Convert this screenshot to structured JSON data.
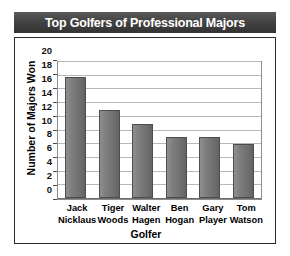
{
  "chart_data": {
    "type": "bar",
    "title": "Top Golfers of Professional Majors",
    "xlabel": "Golfer",
    "ylabel": "Number of Majors Won",
    "categories": [
      "Jack Nicklaus",
      "Tiger Woods",
      "Walter Hagen",
      "Ben Hogan",
      "Gary Player",
      "Tom Watson"
    ],
    "category_lines": [
      [
        "Jack",
        "Nicklaus"
      ],
      [
        "Tiger",
        "Woods"
      ],
      [
        "Walter",
        "Hagen"
      ],
      [
        "Ben",
        "Hogan"
      ],
      [
        "Gary",
        "Player"
      ],
      [
        "Tom",
        "Watson"
      ]
    ],
    "values": [
      18,
      13,
      11,
      9,
      9,
      8
    ],
    "ylim": [
      0,
      20
    ],
    "ytick_step": 2,
    "yticks": [
      0,
      2,
      4,
      6,
      8,
      10,
      12,
      14,
      16,
      18,
      20
    ],
    "grid": true,
    "legend": false,
    "colors": {
      "title_bar_background": "#3f3f3f",
      "title_text": "#ffffff",
      "bar_fill": "#7a7a7a",
      "bar_border": "#4d4d4d",
      "gridline": "#b9b9b9",
      "plot_border": "#8c8c8c",
      "frame_border": "#2b2b2b",
      "plot_background": "#ffffff"
    }
  }
}
